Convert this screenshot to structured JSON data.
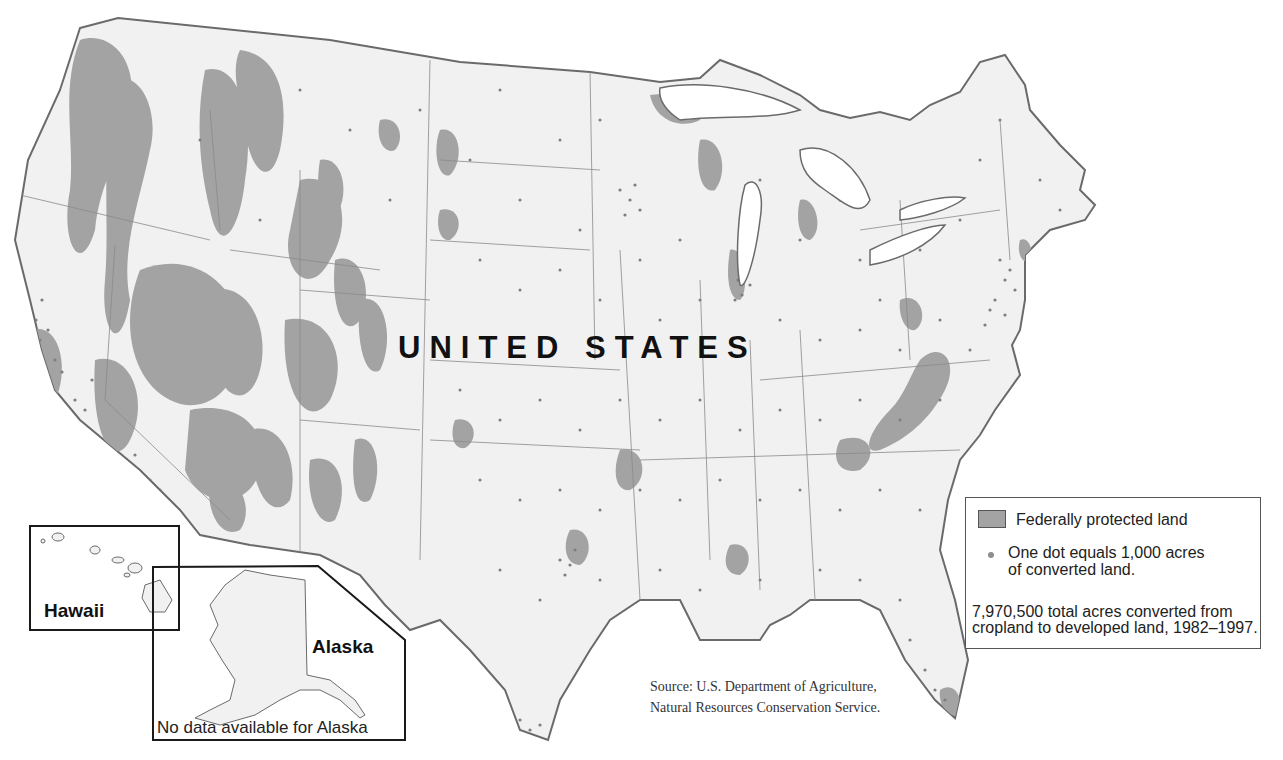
{
  "map": {
    "country_label": "UNITED STATES",
    "colors": {
      "land": "#f1f1f1",
      "protected": "#a3a3a3",
      "dots": "#7e7e7e",
      "borders": "#6a6a6a",
      "water": "#ffffff",
      "inset_frame": "#1a1a1a"
    }
  },
  "insets": {
    "hawaii": {
      "label": "Hawaii"
    },
    "alaska": {
      "label": "Alaska",
      "note": "No data available for Alaska"
    }
  },
  "legend": {
    "protected_label": "Federally protected land",
    "dot_label_line1": "One dot equals 1,000 acres",
    "dot_label_line2": "of converted land.",
    "summary": "7,970,500 total acres converted from cropland to developed land, 1982–1997.",
    "protected_icon": "gray-square-swatch",
    "dot_icon": "gray-dot"
  },
  "source": {
    "line1": "Source: U.S. Department of Agriculture,",
    "line2": "Natural Resources Conservation Service."
  }
}
